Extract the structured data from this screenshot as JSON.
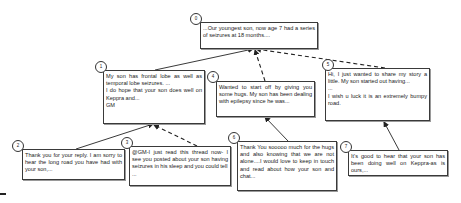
{
  "diagram": {
    "type": "reply-thread-tree",
    "nodes": [
      {
        "id": "0",
        "label": "0",
        "lines": [
          "...Our youngest son, now age 7 had a series of seizures at 18 months...."
        ]
      },
      {
        "id": "1",
        "label": "1",
        "lines": [
          "My son has frontal lobe as well as temporal lobe seizures. ...",
          "I do hope that your son does well on Keppra and...",
          "GM"
        ]
      },
      {
        "id": "2",
        "label": "2",
        "lines": [
          "Thank you for your reply. I am sorry to hear the long road you have had with your son,..."
        ]
      },
      {
        "id": "3",
        "label": "3",
        "lines": [
          "@GM-I just read this thread now- I see you posted about your son having seizures in his sleep and you could tell",
          "..."
        ]
      },
      {
        "id": "4",
        "label": "4",
        "lines": [
          "Wanted to start off by giving you some hugs. My son has been dealing with epilepsy since he was..."
        ]
      },
      {
        "id": "5",
        "label": "5",
        "lines": [
          "Hi, I just wanted to share my story a little. My son started out having...",
          "...",
          "I wish u luck it is an extremely bumpy road."
        ]
      },
      {
        "id": "6",
        "label": "6",
        "lines": [
          "Thank You sooooo much for the hugs and also knowing that we are not alone....I would love to keep in touch and read about how your son and chat..."
        ]
      },
      {
        "id": "7",
        "label": "7",
        "lines": [
          "It's good to hear that your son has been doing well on Keppra-as is ours,..."
        ]
      }
    ],
    "edges": [
      {
        "from": "1",
        "to": "0",
        "style": "solid"
      },
      {
        "from": "4",
        "to": "0",
        "style": "dashed"
      },
      {
        "from": "5",
        "to": "0",
        "style": "dashed"
      },
      {
        "from": "2",
        "to": "1",
        "style": "solid"
      },
      {
        "from": "3",
        "to": "1",
        "style": "dashed"
      },
      {
        "from": "6",
        "to": "4",
        "style": "solid"
      },
      {
        "from": "7",
        "to": "5",
        "style": "solid"
      }
    ],
    "colors": {
      "stroke": "#222222",
      "border": "#3a3a3a",
      "background": "#ffffff"
    }
  }
}
